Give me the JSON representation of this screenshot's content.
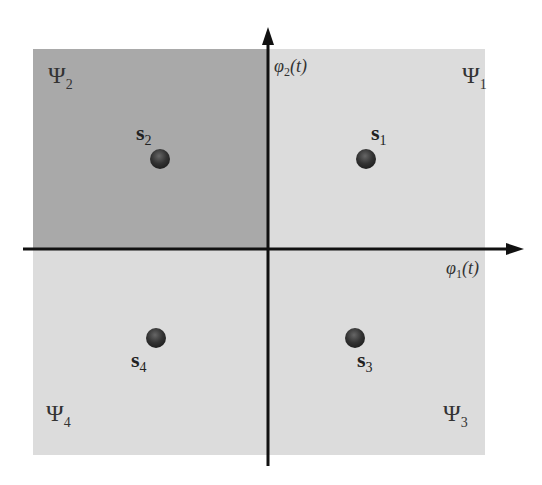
{
  "diagram": {
    "type": "signal-constellation-decision-regions",
    "axes": {
      "x_label_base": "φ",
      "x_label_sub": "1",
      "x_label_arg": "(t)",
      "y_label_base": "φ",
      "y_label_sub": "2",
      "y_label_arg": "(t)"
    },
    "regions": [
      {
        "id": "q1",
        "symbol": "Ψ",
        "sub": "1",
        "color": "#dcdcdc",
        "highlighted": false
      },
      {
        "id": "q2",
        "symbol": "Ψ",
        "sub": "2",
        "color": "#a9a9a9",
        "highlighted": true
      },
      {
        "id": "q3",
        "symbol": "Ψ",
        "sub": "3",
        "color": "#dcdcdc",
        "highlighted": false
      },
      {
        "id": "q4",
        "symbol": "Ψ",
        "sub": "4",
        "color": "#dcdcdc",
        "highlighted": false
      }
    ],
    "signals": [
      {
        "name": "s",
        "sub": "1",
        "quadrant": 1
      },
      {
        "name": "s",
        "sub": "2",
        "quadrant": 2
      },
      {
        "name": "s",
        "sub": "3",
        "quadrant": 4
      },
      {
        "name": "s",
        "sub": "4",
        "quadrant": 3
      }
    ]
  }
}
